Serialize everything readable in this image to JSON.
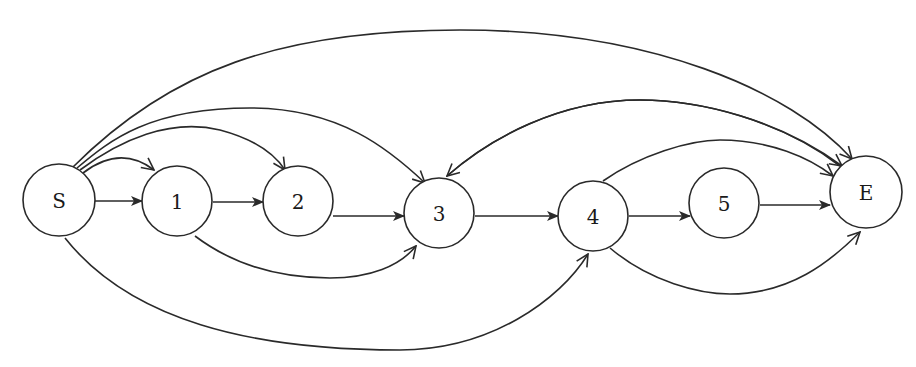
{
  "diagram": {
    "type": "directed-graph",
    "colors": {
      "stroke": "#2a2a2a",
      "fill": "#ffffff",
      "text": "#1a1a1a"
    },
    "nodes": [
      {
        "id": "S",
        "label": "S",
        "x": 59,
        "y": 200,
        "r": 36
      },
      {
        "id": "1",
        "label": "1",
        "x": 177,
        "y": 201,
        "r": 35
      },
      {
        "id": "2",
        "label": "2",
        "x": 298,
        "y": 201,
        "r": 35
      },
      {
        "id": "3",
        "label": "3",
        "x": 439,
        "y": 213,
        "r": 35
      },
      {
        "id": "4",
        "label": "4",
        "x": 593,
        "y": 216,
        "r": 35
      },
      {
        "id": "5",
        "label": "5",
        "x": 724,
        "y": 203,
        "r": 35
      },
      {
        "id": "E",
        "label": "E",
        "x": 866,
        "y": 192,
        "r": 36
      }
    ],
    "edges": [
      {
        "from": "S",
        "to": "1",
        "style": "straight",
        "head": "filled"
      },
      {
        "from": "1",
        "to": "2",
        "style": "straight",
        "head": "filled"
      },
      {
        "from": "2",
        "to": "3",
        "style": "straight",
        "head": "filled"
      },
      {
        "from": "3",
        "to": "4",
        "style": "straight",
        "head": "filled"
      },
      {
        "from": "4",
        "to": "5",
        "style": "straight",
        "head": "filled"
      },
      {
        "from": "5",
        "to": "E",
        "style": "straight",
        "head": "filled"
      },
      {
        "from": "S",
        "to": "1",
        "style": "arc-above",
        "head": "open"
      },
      {
        "from": "S",
        "to": "2",
        "style": "arc-above",
        "head": "open"
      },
      {
        "from": "S",
        "to": "3",
        "style": "arc-above",
        "head": "open"
      },
      {
        "from": "S",
        "to": "E",
        "style": "arc-above",
        "head": "open"
      },
      {
        "from": "S",
        "to": "4",
        "style": "arc-below",
        "head": "open"
      },
      {
        "from": "1",
        "to": "3",
        "style": "arc-below",
        "head": "open"
      },
      {
        "from": "E",
        "to": "3",
        "style": "arc-above",
        "head": "open"
      },
      {
        "from": "3",
        "to": "E",
        "style": "arc-above",
        "head": "open"
      },
      {
        "from": "4",
        "to": "E",
        "style": "arc-above",
        "head": "open"
      },
      {
        "from": "4",
        "to": "E",
        "style": "arc-below",
        "head": "open"
      }
    ]
  }
}
